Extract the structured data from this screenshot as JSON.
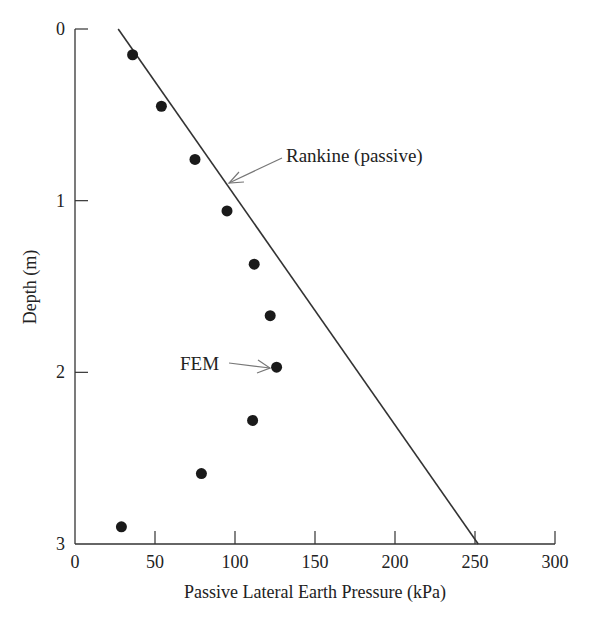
{
  "chart_data": {
    "type": "scatter",
    "title": "",
    "xlabel": "Passive Lateral Earth Pressure (kPa)",
    "ylabel": "Depth (m)",
    "xlim": [
      0,
      300
    ],
    "ylim": [
      0,
      3
    ],
    "y_inverted": true,
    "grid": false,
    "x_ticks": [
      0,
      50,
      100,
      150,
      200,
      250,
      300
    ],
    "y_ticks": [
      0,
      1,
      2,
      3
    ],
    "series": [
      {
        "name": "FEM",
        "kind": "scatter",
        "marker": "filled-circle",
        "points": [
          {
            "pressure": 36,
            "depth": 0.15
          },
          {
            "pressure": 54,
            "depth": 0.45
          },
          {
            "pressure": 75,
            "depth": 0.76
          },
          {
            "pressure": 95,
            "depth": 1.06
          },
          {
            "pressure": 112,
            "depth": 1.37
          },
          {
            "pressure": 122,
            "depth": 1.67
          },
          {
            "pressure": 126,
            "depth": 1.97
          },
          {
            "pressure": 111,
            "depth": 2.28
          },
          {
            "pressure": 79,
            "depth": 2.59
          },
          {
            "pressure": 29,
            "depth": 2.9
          }
        ]
      },
      {
        "name": "Rankine (passive)",
        "kind": "line",
        "points": [
          {
            "pressure": 27,
            "depth": 0
          },
          {
            "pressure": 252,
            "depth": 3
          }
        ]
      }
    ],
    "annotations": [
      {
        "text": "Rankine (passive)",
        "points_to": {
          "pressure": 95,
          "depth": 0.9
        }
      },
      {
        "text": "FEM",
        "points_to": {
          "pressure": 126,
          "depth": 1.97
        }
      }
    ],
    "legend": "none (inline annotations with arrows)"
  },
  "labels": {
    "x_axis": "Passive Lateral Earth Pressure (kPa)",
    "y_axis": "Depth (m)",
    "rankine": "Rankine (passive)",
    "fem": "FEM"
  },
  "colors": {
    "axis": "#333333",
    "points": "#1a1a1a",
    "line": "#333333",
    "arrow": "#777777"
  }
}
